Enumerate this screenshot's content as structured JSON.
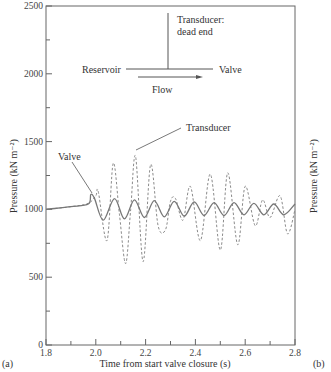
{
  "chart_data": {
    "type": "line",
    "title": "",
    "xlabel": "Time from start valve closure (s)",
    "ylabel": "Pressure (kN m⁻²)",
    "xlim": [
      1.8,
      2.8
    ],
    "ylim": [
      0,
      2500
    ],
    "xticks": [
      "1.8",
      "2.0",
      "2.2",
      "2.4",
      "2.6",
      "2.8"
    ],
    "yticks": [
      "0",
      "500",
      "1000",
      "1500",
      "2000",
      "2500"
    ],
    "grid": false,
    "panel_label": "(a)",
    "next_panel_label": "(b)",
    "next_panel_ylabel_partial": "Pressure (kN m⁻²)",
    "series": [
      {
        "name": "Valve",
        "style": "dashed",
        "x": [
          1.8,
          1.9,
          1.97,
          2.0,
          2.01,
          2.045,
          2.07,
          2.095,
          2.12,
          2.14,
          2.16,
          2.19,
          2.22,
          2.25,
          2.28,
          2.3,
          2.32,
          2.35,
          2.38,
          2.42,
          2.46,
          2.5,
          2.53,
          2.57,
          2.6,
          2.64,
          2.67,
          2.7,
          2.74,
          2.77,
          2.8
        ],
        "values": [
          1000,
          1020,
          1045,
          1100,
          1130,
          770,
          1340,
          960,
          600,
          1000,
          1390,
          615,
          1330,
          880,
          850,
          1060,
          1080,
          920,
          1170,
          770,
          1260,
          700,
          1270,
          740,
          1170,
          880,
          1070,
          940,
          1100,
          820,
          1000
        ]
      },
      {
        "name": "Transducer",
        "style": "solid",
        "x": [
          1.8,
          1.9,
          1.97,
          1.98,
          1.995,
          2.03,
          2.075,
          2.115,
          2.155,
          2.195,
          2.235,
          2.275,
          2.315,
          2.355,
          2.395,
          2.435,
          2.475,
          2.515,
          2.555,
          2.595,
          2.635,
          2.675,
          2.715,
          2.755,
          2.8
        ],
        "values": [
          1000,
          1020,
          1040,
          1110,
          1080,
          920,
          1080,
          930,
          1070,
          940,
          1065,
          945,
          1060,
          950,
          1055,
          955,
          1050,
          955,
          1050,
          960,
          1045,
          960,
          1040,
          960,
          1040
        ]
      }
    ],
    "annotations": {
      "valve_label": "Valve",
      "transducer_label": "Transducer",
      "schematic": {
        "reservoir": "Reservoir",
        "valve": "Valve",
        "transducer_line1": "Transducer:",
        "transducer_line2": "dead end",
        "flow": "Flow"
      }
    }
  }
}
